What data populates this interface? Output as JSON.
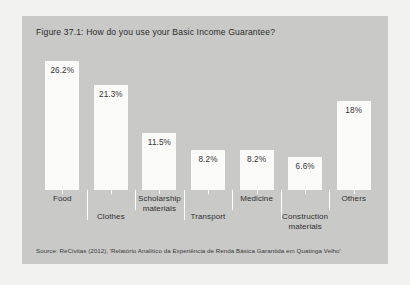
{
  "figure": {
    "title": "Figure 37.1: How do you use your Basic Income Guarantee?",
    "source": "Source: ReCivitas (2012), 'Relatório Analítico da Experiência de Renda Básica Garantida em Quatinga Velho'",
    "panel_color": "#c9c9c7",
    "bar_color": "#fbfbfa",
    "background_color": "#f2f2f0"
  },
  "chart_data": {
    "type": "bar",
    "title": "Figure 37.1: How do you use your Basic Income Guarantee?",
    "xlabel": "",
    "ylabel": "",
    "ylim": [
      0,
      28
    ],
    "grid": false,
    "legend": "none",
    "categories": [
      "Food",
      "Clothes",
      "Scholarship materials",
      "Transport",
      "Medicine",
      "Construction materials",
      "Others"
    ],
    "category_lines": [
      [
        "Food"
      ],
      [
        "Clothes"
      ],
      [
        "Scholarship",
        "materials"
      ],
      [
        "Transport"
      ],
      [
        "Medicine"
      ],
      [
        "Construction",
        "materials"
      ],
      [
        "Others"
      ]
    ],
    "category_label_row": [
      0,
      1,
      0,
      1,
      0,
      1,
      0
    ],
    "values": [
      26.2,
      21.3,
      11.5,
      8.2,
      8.2,
      6.6,
      18
    ],
    "value_labels": [
      "26.2%",
      "21.3%",
      "11.5%",
      "8.2%",
      "8.2%",
      "6.6%",
      "18%"
    ]
  }
}
